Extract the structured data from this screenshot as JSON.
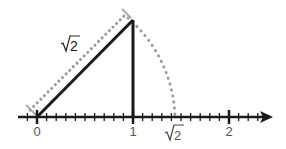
{
  "diagram": {
    "colors": {
      "line": "#1a1a1a",
      "dotted": "#9a9a9a",
      "label": "#555555"
    },
    "hypotenuse_label": "√2",
    "axis": {
      "labels": [
        {
          "text": "0",
          "value": 0
        },
        {
          "text": "1",
          "value": 1
        },
        {
          "text": "√2",
          "value": 1.414
        },
        {
          "text": "2",
          "value": 2
        }
      ],
      "minor_ticks_per_unit": 10
    }
  }
}
